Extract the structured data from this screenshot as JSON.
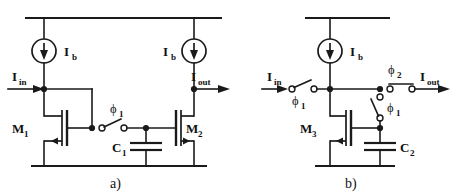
{
  "figure": {
    "background_color": "#ffffff",
    "ink_color": "#1a1a1a"
  },
  "panels": [
    {
      "id": "a",
      "caption": "a)",
      "labels": {
        "input_current": "I",
        "input_current_sub": "in",
        "output_current": "I",
        "output_current_sub": "out",
        "bias_left": "I",
        "bias_left_sub": "b",
        "bias_right": "I",
        "bias_right_sub": "b",
        "transistor_left": "M",
        "transistor_left_sub": "1",
        "transistor_right": "M",
        "transistor_right_sub": "2",
        "capacitor": "C",
        "capacitor_sub": "1",
        "switch_phase": "ϕ",
        "switch_phase_sub": "1"
      }
    },
    {
      "id": "b",
      "caption": "b)",
      "labels": {
        "input_current": "I",
        "input_current_sub": "in",
        "output_current": "I",
        "output_current_sub": "out",
        "bias": "I",
        "bias_sub": "b",
        "transistor": "M",
        "transistor_sub": "3",
        "capacitor": "C",
        "capacitor_sub": "2",
        "switch_input_phase": "ϕ",
        "switch_input_phase_sub": "1",
        "switch_hold_phase": "ϕ",
        "switch_hold_phase_sub": "1",
        "switch_output_phase": "ϕ",
        "switch_output_phase_sub": "2"
      }
    }
  ],
  "components": {
    "current_source_a_left": "current-source",
    "current_source_a_right": "current-source",
    "current_source_b": "current-source",
    "nmos_m1": "nmos-transistor",
    "nmos_m2": "nmos-transistor",
    "nmos_m3": "nmos-transistor",
    "cap_c1": "capacitor",
    "cap_c2": "capacitor",
    "switch_a_phi1": "spst-switch",
    "switch_b_phi1_in": "spst-switch",
    "switch_b_phi1_hold": "spst-switch",
    "switch_b_phi2_out": "spst-switch"
  }
}
